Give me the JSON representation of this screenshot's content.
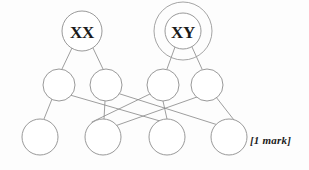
{
  "canvas": {
    "width": 309,
    "height": 170,
    "background": "#fdfdfd"
  },
  "diagram": {
    "type": "genetics-pedigree-network",
    "line_color": "#8d8d8d",
    "node_fill": "#ffffff",
    "text_color": "#1a1a1a",
    "parents": [
      {
        "id": "parent-xx",
        "label": "XX",
        "cx": 82,
        "cy": 31,
        "r": 20,
        "double_ring": false,
        "outer_r": 0
      },
      {
        "id": "parent-xy",
        "label": "XY",
        "cx": 183,
        "cy": 31,
        "r": 18,
        "double_ring": true,
        "outer_r": 29
      }
    ],
    "middle_row": [
      {
        "id": "gamete-1",
        "label": "",
        "cx": 59,
        "cy": 85,
        "r": 16
      },
      {
        "id": "gamete-2",
        "label": "",
        "cx": 106,
        "cy": 85,
        "r": 16
      },
      {
        "id": "gamete-3",
        "label": "",
        "cx": 163,
        "cy": 85,
        "r": 16
      },
      {
        "id": "gamete-4",
        "label": "",
        "cx": 207,
        "cy": 85,
        "r": 16
      }
    ],
    "bottom_row": [
      {
        "id": "offspring-1",
        "label": "",
        "cx": 40,
        "cy": 137,
        "r": 18
      },
      {
        "id": "offspring-2",
        "label": "",
        "cx": 103,
        "cy": 137,
        "r": 18
      },
      {
        "id": "offspring-3",
        "label": "",
        "cx": 167,
        "cy": 137,
        "r": 18
      },
      {
        "id": "offspring-4",
        "label": "",
        "cx": 229,
        "cy": 137,
        "r": 18
      }
    ],
    "edges": [
      {
        "id": "edge-xx-g1",
        "x1": 72,
        "y1": 48,
        "x2": 62,
        "y2": 69
      },
      {
        "id": "edge-xx-g2",
        "x1": 93,
        "y1": 48,
        "x2": 103,
        "y2": 69
      },
      {
        "id": "edge-xy-g3",
        "x1": 175,
        "y1": 47,
        "x2": 167,
        "y2": 69
      },
      {
        "id": "edge-xy-g4",
        "x1": 192,
        "y1": 47,
        "x2": 202,
        "y2": 69
      },
      {
        "id": "edge-g1-o1",
        "x1": 52,
        "y1": 99,
        "x2": 44,
        "y2": 119
      },
      {
        "id": "edge-g1-o3",
        "x1": 70,
        "y1": 95,
        "x2": 160,
        "y2": 121
      },
      {
        "id": "edge-g2-o2",
        "x1": 105,
        "y1": 101,
        "x2": 104,
        "y2": 119
      },
      {
        "id": "edge-g2-o4",
        "x1": 117,
        "y1": 93,
        "x2": 218,
        "y2": 125
      },
      {
        "id": "edge-g3-o2",
        "x1": 152,
        "y1": 93,
        "x2": 92,
        "y2": 122
      },
      {
        "id": "edge-g3-o3",
        "x1": 163,
        "y1": 101,
        "x2": 167,
        "y2": 119
      },
      {
        "id": "edge-g4-o4",
        "x1": 216,
        "y1": 97,
        "x2": 234,
        "y2": 120
      },
      {
        "id": "edge-g4-o2",
        "x1": 197,
        "y1": 97,
        "x2": 115,
        "y2": 126
      }
    ]
  },
  "annotation": {
    "mark_text": "[1 mark]",
    "x": 250,
    "y": 139
  }
}
